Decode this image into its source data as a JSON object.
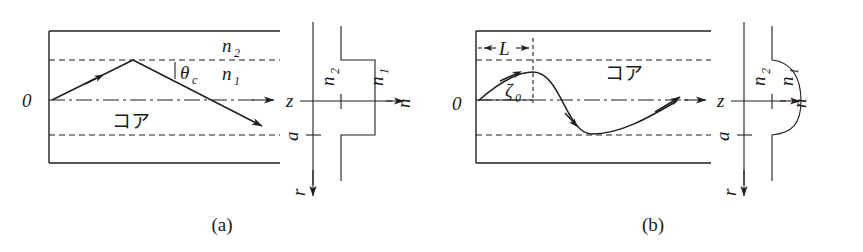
{
  "figure": {
    "kind": "optical-fiber-ray-propagation",
    "panels": [
      {
        "id": "a",
        "caption": "(a)",
        "caption_x": 222,
        "caption_y": 231,
        "type": "step-index",
        "core_label": "コア",
        "origin_label": "0",
        "axis_z_label": "z",
        "axis_r_label": "r",
        "axis_n_label": "n",
        "radius_label": "a",
        "cladding_index_label": "n",
        "cladding_index_sub": "2",
        "core_index_label": "n",
        "core_index_sub": "1",
        "angle_label": "θ",
        "angle_sub": "c",
        "profile_index_outer_label": "n",
        "profile_index_outer_sub": "2",
        "profile_index_inner_label": "n",
        "profile_index_inner_sub": "1"
      },
      {
        "id": "b",
        "caption": "(b)",
        "caption_x": 653,
        "caption_y": 231,
        "type": "graded-index",
        "core_label": "コア",
        "origin_label": "0",
        "axis_z_label": "z",
        "axis_r_label": "r",
        "axis_n_label": "n",
        "radius_label": "a",
        "period_label": "L",
        "launch_angle_label": "ζ",
        "launch_angle_sub": "0",
        "profile_index_outer_label": "n",
        "profile_index_outer_sub": "2",
        "profile_index_inner_label": "n",
        "profile_index_inner_sub": "1"
      }
    ]
  },
  "colors": {
    "ink": "#1a1a1a",
    "background": "#ffffff"
  }
}
